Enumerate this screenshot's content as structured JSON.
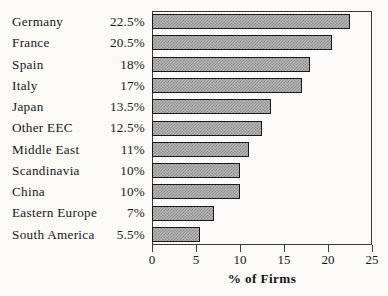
{
  "chart_data": {
    "type": "bar",
    "orientation": "horizontal",
    "title": "",
    "xlabel": "% of Firms",
    "ylabel": "",
    "xlim": [
      0,
      25
    ],
    "xticks": [
      0,
      5,
      10,
      15,
      20,
      25
    ],
    "xtick_labels": [
      "0",
      "5",
      "10",
      "15",
      "20",
      "25"
    ],
    "grid": false,
    "legend": null,
    "categories": [
      "Germany",
      "France",
      "Spain",
      "Italy",
      "Japan",
      "Other EEC",
      "Middle East",
      "Scandinavia",
      "China",
      "Eastern Europe",
      "South America"
    ],
    "values": [
      22.5,
      20.5,
      18,
      17,
      13.5,
      12.5,
      11,
      10,
      10,
      7,
      5.5
    ],
    "value_labels": [
      "22.5%",
      "20.5%",
      "18%",
      "17%",
      "13.5%",
      "12.5%",
      "11%",
      "10%",
      "10%",
      "7%",
      "5.5%"
    ],
    "bar_fill_color": "#b4b4b4",
    "bar_pattern": "checker-dither",
    "bar_edge_color": "#1a1a1c",
    "axis_color": "#3a3a3c",
    "background_color": "#fbfaf7"
  }
}
